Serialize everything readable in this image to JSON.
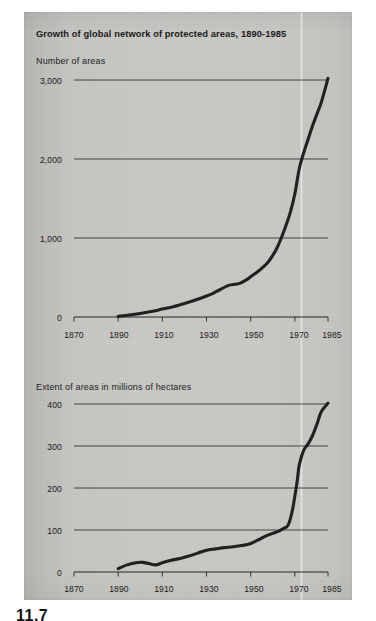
{
  "figure": {
    "title": "Growth of global network of protected areas, 1890-1985",
    "page_number": "11.7",
    "background_color": "#c8c8c4",
    "line_color": "#1a1a1a"
  },
  "charts": {
    "top": {
      "caption": "Number of areas",
      "y_ticks": [
        "3,000",
        "2,000",
        "1,000",
        "0"
      ],
      "x_ticks": [
        "1870",
        "1890",
        "1910",
        "1930",
        "1950",
        "1970",
        "1985"
      ]
    },
    "bottom": {
      "caption": "Extent of areas in millions of hectares",
      "y_ticks": [
        "400",
        "300",
        "200",
        "100",
        "0"
      ],
      "x_ticks": [
        "1870",
        "1890",
        "1910",
        "1930",
        "1950",
        "1970",
        "1985"
      ]
    }
  },
  "chart_data": [
    {
      "type": "line",
      "id": "number-of-areas",
      "title": "Growth of global network of protected areas, 1890-1985",
      "subtitle": "Number of areas",
      "xlabel": "",
      "ylabel": "Number of areas",
      "xlim": [
        1870,
        1985
      ],
      "ylim": [
        0,
        3000
      ],
      "xticks": [
        1870,
        1890,
        1910,
        1930,
        1950,
        1970,
        1985
      ],
      "yticks": [
        0,
        1000,
        2000,
        3000
      ],
      "grid": "horizontal",
      "legend": "none",
      "series": [
        {
          "name": "Number of protected areas",
          "x": [
            1890,
            1895,
            1900,
            1905,
            1910,
            1915,
            1920,
            1925,
            1930,
            1933,
            1936,
            1940,
            1943,
            1945,
            1948,
            1950,
            1953,
            1956,
            1958,
            1960,
            1962,
            1964,
            1966,
            1968,
            1970,
            1972,
            1974,
            1976,
            1978,
            1980,
            1982,
            1985
          ],
          "y": [
            10,
            25,
            45,
            70,
            100,
            130,
            170,
            215,
            265,
            300,
            345,
            400,
            415,
            425,
            470,
            510,
            570,
            640,
            700,
            780,
            880,
            1010,
            1160,
            1330,
            1560,
            1880,
            2080,
            2250,
            2420,
            2570,
            2720,
            3020
          ]
        }
      ]
    },
    {
      "type": "line",
      "id": "extent-of-areas",
      "title": "Growth of global network of protected areas, 1890-1985",
      "subtitle": "Extent of areas in millions of hectares",
      "xlabel": "",
      "ylabel": "Extent of areas in millions of hectares",
      "xlim": [
        1870,
        1985
      ],
      "ylim": [
        0,
        400
      ],
      "xticks": [
        1870,
        1890,
        1910,
        1930,
        1950,
        1970,
        1985
      ],
      "yticks": [
        0,
        100,
        200,
        300,
        400
      ],
      "grid": "horizontal",
      "legend": "none",
      "series": [
        {
          "name": "Extent of protected areas (million hectares)",
          "x": [
            1890,
            1894,
            1898,
            1901,
            1904,
            1907,
            1910,
            1914,
            1918,
            1922,
            1926,
            1930,
            1934,
            1938,
            1942,
            1946,
            1950,
            1954,
            1957,
            1960,
            1963,
            1965,
            1967,
            1969,
            1971,
            1972,
            1974,
            1976,
            1978,
            1980,
            1982,
            1985
          ],
          "y": [
            8,
            17,
            22,
            23,
            20,
            17,
            22,
            28,
            32,
            38,
            45,
            52,
            55,
            58,
            60,
            63,
            68,
            78,
            86,
            92,
            98,
            104,
            112,
            150,
            215,
            255,
            290,
            305,
            325,
            352,
            382,
            402
          ]
        }
      ]
    }
  ]
}
